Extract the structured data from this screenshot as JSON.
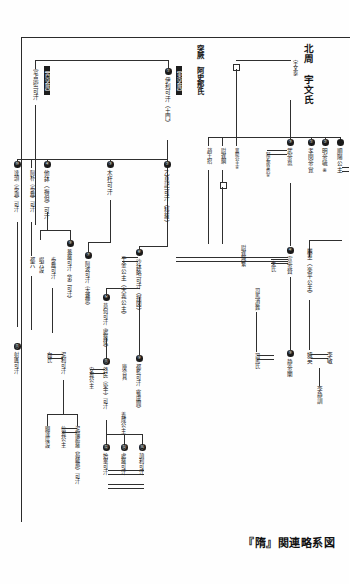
{
  "figure": {
    "caption": "『隋』関連略系図",
    "groups": [
      {
        "id": "west-turk",
        "tag": "【西突厥】"
      },
      {
        "id": "east-turk",
        "tag": "【東突厥】"
      }
    ],
    "clans": [
      {
        "id": "northern-zhou",
        "title": "北周　宇文氏"
      },
      {
        "id": "turk-ashina",
        "title": "突厥　阿史那氏"
      }
    ]
  },
  "people": {
    "zhou": {
      "founder": "宇文泰",
      "unknown_spouse": "□",
      "xiaomin": {
        "num": "①",
        "name": "孝閔帝覚"
      },
      "mingdi": {
        "num": "②",
        "name": "明帝毓※"
      },
      "wudi": {
        "num": "③",
        "name": "武帝邕"
      },
      "ashina_empress": "阿史那皇后※",
      "shunyang": "順陽公主",
      "xiangyang": "襄陽公主※",
      "yuchi_gang": "尉遅綱",
      "zhao_wang_zhao": "趙王招",
      "xuandi": {
        "num": "④",
        "name": "宣帝贇"
      },
      "zhushi": "朱氏",
      "yuchi_chifan": "尉遅熾繁",
      "sima_xiaonan": "司馬消難",
      "simashi": "司馬氏",
      "jingdi": {
        "num": "⑤",
        "name": "静帝闡"
      },
      "lihua": "麗華（楽平公主）",
      "eying": "娥英",
      "limin": "李敏",
      "lijingxun": "李静訓"
    },
    "turk": {
      "west": {
        "shidianmi": "室点密可汗",
        "datou": {
          "num": "⑩",
          "name": "達頭（歩迦）可汗"
        },
        "apu": "阿朴（歩離）可汗",
        "duliu": "都六",
        "shekui": {
          "num": "⑪",
          "name": "射匱可汗"
        },
        "nili": "泥利可汗",
        "xiangshi": "向氏",
        "nijue_chuluo": "泥撮處羅（曷薩那）可汗",
        "xinyi": "信義公主",
        "quedadu": "闕達度設"
      },
      "east": {
        "tumen": {
          "num": "①",
          "name": "伊利可汗（土門）"
        },
        "yixiji": {
          "num": "②",
          "name": "乙息記可汗（科羅）"
        },
        "muhan": {
          "num": "③",
          "name": "木杆可汗"
        },
        "tabo": {
          "num": "④",
          "name": "他鉢（褥但）可汗"
        },
        "anluo": {
          "num": "⑤",
          "name": "菴羅可汗（第二可汗）"
        },
        "dalobian": "大邏便",
        "shabolue": {
          "num": "⑥",
          "name": "沙鉢略可汗（摂図）"
        },
        "apo": {
          "num": "⑦",
          "name": "阿波可汗（大邏便）"
        },
        "mohe": {
          "num": "⑧",
          "name": "莫何可汗（處羅侯）"
        },
        "dulan": {
          "num": "⑨",
          "name": "都藍可汗（雍虞閭）"
        },
        "qimin": {
          "num": "⑪",
          "name": "啓民（染干）可汗"
        },
        "shibi": {
          "num": "⑫",
          "name": "始畢可汗"
        },
        "chuluo": {
          "num": "⑬",
          "name": "處羅可汗"
        },
        "xieli": {
          "num": "⑭",
          "name": "頡利可汗"
        },
        "kuhezhen": "庫合真",
        "chang_liu_she": "唱六設",
        "bulishe": "歩離可汗",
        "qianjin": "千金公主（大義公主）",
        "anyi": "安義公主",
        "yicheng": "義成公主"
      }
    }
  }
}
